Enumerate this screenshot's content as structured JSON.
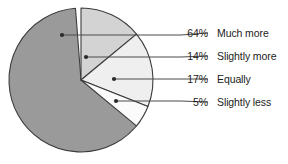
{
  "chart_data": {
    "type": "pie",
    "title": "",
    "subtitle": "",
    "xlabel": "",
    "ylabel": "",
    "grid": false,
    "legend_position": "right",
    "categories": [
      "Much more",
      "Slightly more",
      "Equally",
      "Slightly less"
    ],
    "values": [
      64,
      14,
      17,
      5
    ],
    "value_labels": [
      "64%",
      "14%",
      "17%",
      "5%"
    ],
    "units": "percent",
    "start_angle_deg": 0,
    "direction": "clockwise",
    "center": {
      "x": 81,
      "y": 80
    },
    "radius": 72,
    "slices": [
      {
        "label": "Much more",
        "value": 64,
        "value_label": "64%",
        "fill": "#9a9a9a",
        "start_deg": 125.2,
        "end_deg": 355.6,
        "callout_dot": {
          "x": 62,
          "y": 35
        },
        "leader_points": "62,35 181,35 208,33"
      },
      {
        "label": "Slightly more",
        "value": 14,
        "value_label": "14%",
        "fill": "#d3d3d3",
        "start_deg": 0,
        "end_deg": 50.4,
        "callout_dot": {
          "x": 86,
          "y": 57
        },
        "leader_points": "86,57 181,57 208,56"
      },
      {
        "label": "Equally",
        "value": 17,
        "value_label": "17%",
        "fill": "#efefef",
        "start_deg": 50.4,
        "end_deg": 111.6,
        "callout_dot": {
          "x": 114,
          "y": 79
        },
        "leader_points": "114,79 181,79 208,79"
      },
      {
        "label": "Slightly less",
        "value": 5,
        "value_label": "5%",
        "fill": "#fbfbfb",
        "start_deg": 111.6,
        "end_deg": 129.6,
        "callout_dot": {
          "x": 116,
          "y": 101
        },
        "leader_points": "116,101 181,101 208,102"
      }
    ],
    "colors": {
      "slice_much_more": "#9a9a9a",
      "slice_slightly_more": "#d3d3d3",
      "slice_equally": "#efefef",
      "slice_slightly_less": "#fbfbfb",
      "outline": "#3c3c3c",
      "leader_line": "#4a4a4a",
      "text": "#1c1c1c",
      "background": "#ffffff"
    }
  },
  "legend": {
    "rows": [
      {
        "percent": "64%",
        "label": "Much more"
      },
      {
        "percent": "14%",
        "label": "Slightly more"
      },
      {
        "percent": "17%",
        "label": "Equally"
      },
      {
        "percent": "5%",
        "label": "Slightly less"
      }
    ]
  }
}
